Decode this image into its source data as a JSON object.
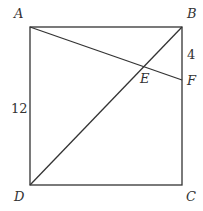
{
  "diagram": {
    "type": "geometry",
    "shape": "square",
    "colors": {
      "stroke": "#333333",
      "background": "#ffffff"
    },
    "points": {
      "A": {
        "label": "A",
        "x": 30,
        "y": 27
      },
      "B": {
        "label": "B",
        "x": 182,
        "y": 27
      },
      "C": {
        "label": "C",
        "x": 182,
        "y": 185
      },
      "D": {
        "label": "D",
        "x": 30,
        "y": 185
      },
      "E": {
        "label": "E",
        "x": 144,
        "y": 67
      },
      "F": {
        "label": "F",
        "x": 182,
        "y": 80
      }
    },
    "segments": [
      "AB",
      "BC",
      "CD",
      "DA",
      "BD",
      "AF"
    ],
    "measurements": {
      "AD": "12",
      "BF": "4"
    }
  }
}
